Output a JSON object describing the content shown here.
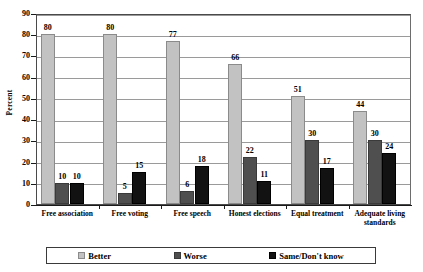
{
  "chart_data": {
    "type": "bar",
    "title": "",
    "subtitle": "",
    "xlabel": "",
    "ylabel": "Percent",
    "ylim": [
      0,
      90
    ],
    "ytick_step": 10,
    "yticks": [
      0,
      10,
      20,
      30,
      40,
      50,
      60,
      70,
      80,
      90
    ],
    "grid": true,
    "legend_position": "bottom",
    "categories": [
      "Free association",
      "Free voting",
      "Free speech",
      "Honest elections",
      "Equal treatment",
      "Adequate living standards"
    ],
    "series": [
      {
        "name": "Better",
        "color": "#c2c2c2",
        "values": [
          80,
          80,
          77,
          66,
          51,
          44
        ]
      },
      {
        "name": "Worse",
        "color": "#4f4f4f",
        "values": [
          10,
          5,
          6,
          22,
          30,
          30
        ]
      },
      {
        "name": "Same/Don't know",
        "color": "#121212",
        "values": [
          10,
          15,
          18,
          11,
          17,
          24
        ]
      }
    ],
    "data_labels": true
  },
  "axis": {
    "y_title": "Percent",
    "y_labels": [
      "90",
      "80",
      "70",
      "60",
      "50",
      "40",
      "30",
      "20",
      "10",
      "0"
    ]
  },
  "legend": {
    "items": [
      {
        "label": "Better",
        "swatch": "better"
      },
      {
        "label": "Worse",
        "swatch": "worse"
      },
      {
        "label": "Same/Don't know",
        "swatch": "same"
      }
    ]
  },
  "categories_display": [
    {
      "line1": "Free association",
      "line2": ""
    },
    {
      "line1": "Free voting",
      "line2": ""
    },
    {
      "line1": "Free speech",
      "line2": ""
    },
    {
      "line1": "Honest elections",
      "line2": ""
    },
    {
      "line1": "Equal treatment",
      "line2": ""
    },
    {
      "line1": "Adequate living",
      "line2": "standards"
    }
  ]
}
